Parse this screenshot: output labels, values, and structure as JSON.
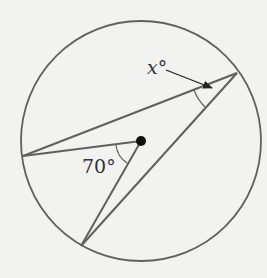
{
  "diagram": {
    "type": "circle-geometry",
    "colors": {
      "background": "#f2f2f1",
      "stroke": "#606060",
      "dot": "#111111",
      "text": "#333333"
    },
    "circle": {
      "cx": 141,
      "cy": 141,
      "r": 120
    },
    "points": {
      "center": {
        "x": 141,
        "y": 141
      },
      "left": {
        "x": 23,
        "y": 156
      },
      "upper_right": {
        "x": 237,
        "y": 73
      },
      "bottom": {
        "x": 81,
        "y": 246
      }
    },
    "labels": {
      "inscribed_angle": "x°",
      "central_angle": "70°"
    },
    "angles": {
      "central_angle_degrees": 70,
      "inscribed_angle_variable": "x"
    }
  }
}
